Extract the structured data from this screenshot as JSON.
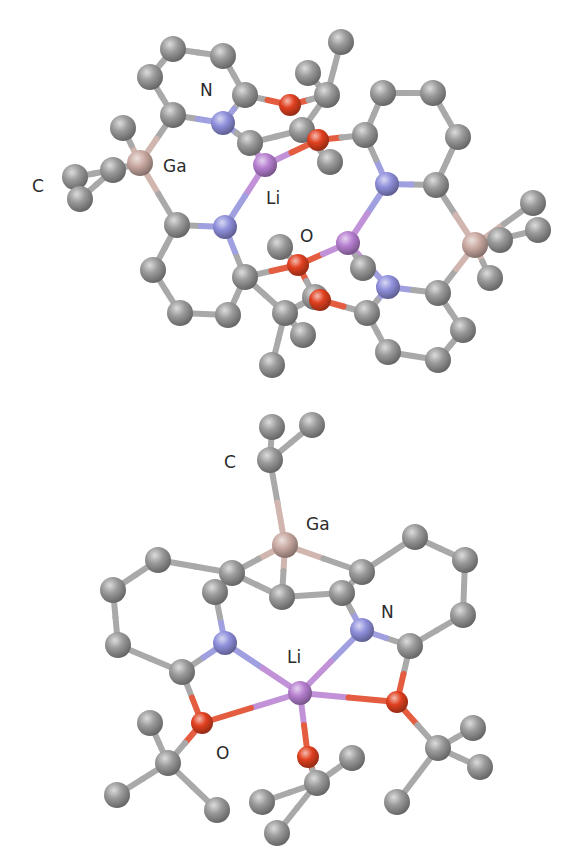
{
  "figure": {
    "panels": [
      {
        "id": "top",
        "description": "Dimeric Li/Ga complex, ball-and-stick",
        "labels": [
          {
            "text": "N",
            "x": 200,
            "y": 96
          },
          {
            "text": "Ga",
            "x": 163,
            "y": 172
          },
          {
            "text": "C",
            "x": 32,
            "y": 192
          },
          {
            "text": "Li",
            "x": 266,
            "y": 204
          },
          {
            "text": "O",
            "x": 300,
            "y": 242
          }
        ],
        "atoms": [
          {
            "id": "a1",
            "el": "C",
            "x": 173,
            "y": 49
          },
          {
            "id": "a2",
            "el": "C",
            "x": 223,
            "y": 56
          },
          {
            "id": "a3",
            "el": "C",
            "x": 150,
            "y": 77
          },
          {
            "id": "a4",
            "el": "C",
            "x": 245,
            "y": 95
          },
          {
            "id": "a5",
            "el": "C",
            "x": 173,
            "y": 115
          },
          {
            "id": "n1",
            "el": "N",
            "x": 223,
            "y": 123
          },
          {
            "id": "a6",
            "el": "C",
            "x": 250,
            "y": 143
          },
          {
            "id": "ga1",
            "el": "Ga",
            "x": 140,
            "y": 163
          },
          {
            "id": "m1",
            "el": "C",
            "x": 123,
            "y": 128
          },
          {
            "id": "m2",
            "el": "C",
            "x": 113,
            "y": 170
          },
          {
            "id": "m3",
            "el": "C",
            "x": 75,
            "y": 177
          },
          {
            "id": "m4",
            "el": "C",
            "x": 80,
            "y": 199
          },
          {
            "id": "li1",
            "el": "Li",
            "x": 265,
            "y": 165
          },
          {
            "id": "o1",
            "el": "O",
            "x": 290,
            "y": 105
          },
          {
            "id": "t1",
            "el": "C",
            "x": 341,
            "y": 42
          },
          {
            "id": "t2",
            "el": "C",
            "x": 308,
            "y": 73
          },
          {
            "id": "t3",
            "el": "C",
            "x": 327,
            "y": 95
          },
          {
            "id": "t4",
            "el": "C",
            "x": 302,
            "y": 130
          },
          {
            "id": "o2",
            "el": "O",
            "x": 318,
            "y": 140
          },
          {
            "id": "t5",
            "el": "C",
            "x": 330,
            "y": 162
          },
          {
            "id": "r1",
            "el": "C",
            "x": 383,
            "y": 93
          },
          {
            "id": "r2",
            "el": "C",
            "x": 433,
            "y": 93
          },
          {
            "id": "r3",
            "el": "C",
            "x": 365,
            "y": 135
          },
          {
            "id": "r4",
            "el": "C",
            "x": 458,
            "y": 137
          },
          {
            "id": "n2",
            "el": "N",
            "x": 387,
            "y": 184
          },
          {
            "id": "r5",
            "el": "C",
            "x": 436,
            "y": 185
          },
          {
            "id": "b1",
            "el": "C",
            "x": 177,
            "y": 225
          },
          {
            "id": "n3",
            "el": "N",
            "x": 225,
            "y": 227
          },
          {
            "id": "b2",
            "el": "C",
            "x": 153,
            "y": 270
          },
          {
            "id": "b3",
            "el": "C",
            "x": 245,
            "y": 277
          },
          {
            "id": "b4",
            "el": "C",
            "x": 180,
            "y": 313
          },
          {
            "id": "b5",
            "el": "C",
            "x": 228,
            "y": 315
          },
          {
            "id": "li2",
            "el": "Li",
            "x": 348,
            "y": 243
          },
          {
            "id": "q1",
            "el": "C",
            "x": 280,
            "y": 247
          },
          {
            "id": "o3",
            "el": "O",
            "x": 298,
            "y": 265
          },
          {
            "id": "q2",
            "el": "C",
            "x": 285,
            "y": 313
          },
          {
            "id": "q3",
            "el": "C",
            "x": 315,
            "y": 297
          },
          {
            "id": "q4",
            "el": "C",
            "x": 303,
            "y": 335
          },
          {
            "id": "q5",
            "el": "C",
            "x": 272,
            "y": 365
          },
          {
            "id": "q6",
            "el": "C",
            "x": 363,
            "y": 268
          },
          {
            "id": "o4",
            "el": "O",
            "x": 320,
            "y": 300
          },
          {
            "id": "ga2",
            "el": "Ga",
            "x": 475,
            "y": 245
          },
          {
            "id": "m5",
            "el": "C",
            "x": 533,
            "y": 203
          },
          {
            "id": "m6",
            "el": "C",
            "x": 538,
            "y": 230
          },
          {
            "id": "m7",
            "el": "C",
            "x": 500,
            "y": 240
          },
          {
            "id": "m8",
            "el": "C",
            "x": 490,
            "y": 278
          },
          {
            "id": "n4",
            "el": "N",
            "x": 388,
            "y": 287
          },
          {
            "id": "s1",
            "el": "C",
            "x": 438,
            "y": 293
          },
          {
            "id": "s2",
            "el": "C",
            "x": 367,
            "y": 313
          },
          {
            "id": "s3",
            "el": "C",
            "x": 463,
            "y": 330
          },
          {
            "id": "s4",
            "el": "C",
            "x": 388,
            "y": 352
          },
          {
            "id": "s5",
            "el": "C",
            "x": 438,
            "y": 360
          }
        ],
        "bonds": [
          [
            "a1",
            "a2"
          ],
          [
            "a1",
            "a3"
          ],
          [
            "a2",
            "a4"
          ],
          [
            "a3",
            "a5"
          ],
          [
            "a5",
            "n1"
          ],
          [
            "a4",
            "n1"
          ],
          [
            "n1",
            "a6"
          ],
          [
            "a5",
            "ga1"
          ],
          [
            "ga1",
            "m1"
          ],
          [
            "ga1",
            "m2"
          ],
          [
            "m2",
            "m3"
          ],
          [
            "m2",
            "m4"
          ],
          [
            "a6",
            "li1"
          ],
          [
            "a4",
            "o1"
          ],
          [
            "o1",
            "t3"
          ],
          [
            "t3",
            "t1"
          ],
          [
            "t3",
            "t2"
          ],
          [
            "t3",
            "t4"
          ],
          [
            "a6",
            "t4"
          ],
          [
            "li1",
            "o2"
          ],
          [
            "o2",
            "t4"
          ],
          [
            "o2",
            "r3"
          ],
          [
            "t4",
            "t5"
          ],
          [
            "r3",
            "r1"
          ],
          [
            "r1",
            "r2"
          ],
          [
            "r2",
            "r4"
          ],
          [
            "r4",
            "r5"
          ],
          [
            "r5",
            "n2"
          ],
          [
            "n2",
            "r3"
          ],
          [
            "n2",
            "li2"
          ],
          [
            "li1",
            "n3"
          ],
          [
            "r5",
            "ga2"
          ],
          [
            "ga1",
            "b1"
          ],
          [
            "b1",
            "n3"
          ],
          [
            "b1",
            "b2"
          ],
          [
            "b2",
            "b4"
          ],
          [
            "b4",
            "b5"
          ],
          [
            "b5",
            "b3"
          ],
          [
            "b3",
            "n3"
          ],
          [
            "b3",
            "o3"
          ],
          [
            "o3",
            "li2"
          ],
          [
            "o3",
            "q1"
          ],
          [
            "o3",
            "q3"
          ],
          [
            "b3",
            "q2"
          ],
          [
            "q2",
            "q4"
          ],
          [
            "q2",
            "q5"
          ],
          [
            "q2",
            "q3"
          ],
          [
            "li2",
            "n4"
          ],
          [
            "li2",
            "q6"
          ],
          [
            "n4",
            "s1"
          ],
          [
            "n4",
            "s2"
          ],
          [
            "s2",
            "o4"
          ],
          [
            "o4",
            "q3"
          ],
          [
            "s1",
            "ga2"
          ],
          [
            "s1",
            "s3"
          ],
          [
            "s3",
            "s5"
          ],
          [
            "s5",
            "s4"
          ],
          [
            "s4",
            "s2"
          ],
          [
            "ga2",
            "m5"
          ],
          [
            "ga2",
            "m6"
          ],
          [
            "ga2",
            "m7"
          ],
          [
            "ga2",
            "m8"
          ]
        ]
      },
      {
        "id": "bottom",
        "description": "Monomeric Li/Ga complex, ball-and-stick",
        "labels": [
          {
            "text": "C",
            "x": 224,
            "y": 468
          },
          {
            "text": "Ga",
            "x": 306,
            "y": 530
          },
          {
            "text": "N",
            "x": 381,
            "y": 618
          },
          {
            "text": "Li",
            "x": 287,
            "y": 663
          },
          {
            "text": "O",
            "x": 216,
            "y": 759
          }
        ],
        "atoms": [
          {
            "id": "c1",
            "el": "C",
            "x": 272,
            "y": 427
          },
          {
            "id": "c2",
            "el": "C",
            "x": 312,
            "y": 425
          },
          {
            "id": "c3",
            "el": "C",
            "x": 270,
            "y": 460
          },
          {
            "id": "ga",
            "el": "Ga",
            "x": 285,
            "y": 545
          },
          {
            "id": "l1",
            "el": "C",
            "x": 158,
            "y": 560
          },
          {
            "id": "l2",
            "el": "C",
            "x": 113,
            "y": 590
          },
          {
            "id": "l3",
            "el": "C",
            "x": 232,
            "y": 573
          },
          {
            "id": "l4",
            "el": "C",
            "x": 215,
            "y": 592
          },
          {
            "id": "l5",
            "el": "C",
            "x": 118,
            "y": 645
          },
          {
            "id": "mid",
            "el": "C",
            "x": 282,
            "y": 597
          },
          {
            "id": "r1",
            "el": "C",
            "x": 415,
            "y": 537
          },
          {
            "id": "r2",
            "el": "C",
            "x": 465,
            "y": 560
          },
          {
            "id": "r3",
            "el": "C",
            "x": 362,
            "y": 572
          },
          {
            "id": "r4",
            "el": "C",
            "x": 342,
            "y": 593
          },
          {
            "id": "r5",
            "el": "C",
            "x": 463,
            "y": 615
          },
          {
            "id": "nl",
            "el": "N",
            "x": 225,
            "y": 643
          },
          {
            "id": "nr",
            "el": "N",
            "x": 362,
            "y": 630
          },
          {
            "id": "cl",
            "el": "C",
            "x": 182,
            "y": 672
          },
          {
            "id": "cr",
            "el": "C",
            "x": 410,
            "y": 646
          },
          {
            "id": "li",
            "el": "Li",
            "x": 300,
            "y": 693
          },
          {
            "id": "ol",
            "el": "O",
            "x": 202,
            "y": 723
          },
          {
            "id": "or",
            "el": "O",
            "x": 397,
            "y": 702
          },
          {
            "id": "ob",
            "el": "O",
            "x": 308,
            "y": 757
          },
          {
            "id": "tl1",
            "el": "C",
            "x": 150,
            "y": 723
          },
          {
            "id": "tl2",
            "el": "C",
            "x": 168,
            "y": 763
          },
          {
            "id": "tl3",
            "el": "C",
            "x": 117,
            "y": 795
          },
          {
            "id": "tl4",
            "el": "C",
            "x": 217,
            "y": 810
          },
          {
            "id": "tb1",
            "el": "C",
            "x": 352,
            "y": 758
          },
          {
            "id": "tb2",
            "el": "C",
            "x": 317,
            "y": 783
          },
          {
            "id": "tb3",
            "el": "C",
            "x": 262,
            "y": 802
          },
          {
            "id": "tb4",
            "el": "C",
            "x": 277,
            "y": 833
          },
          {
            "id": "tr1",
            "el": "C",
            "x": 438,
            "y": 748
          },
          {
            "id": "tr2",
            "el": "C",
            "x": 473,
            "y": 728
          },
          {
            "id": "tr3",
            "el": "C",
            "x": 480,
            "y": 767
          },
          {
            "id": "tr4",
            "el": "C",
            "x": 397,
            "y": 802
          }
        ],
        "bonds": [
          [
            "c3",
            "c1"
          ],
          [
            "c3",
            "c2"
          ],
          [
            "c3",
            "ga"
          ],
          [
            "ga",
            "l3"
          ],
          [
            "ga",
            "mid"
          ],
          [
            "ga",
            "r3"
          ],
          [
            "l3",
            "l1"
          ],
          [
            "l1",
            "l2"
          ],
          [
            "l2",
            "l5"
          ],
          [
            "l5",
            "cl"
          ],
          [
            "cl",
            "nl"
          ],
          [
            "nl",
            "l4"
          ],
          [
            "l4",
            "l3"
          ],
          [
            "mid",
            "l3"
          ],
          [
            "mid",
            "r4"
          ],
          [
            "r4",
            "r3"
          ],
          [
            "r3",
            "r1"
          ],
          [
            "r1",
            "r2"
          ],
          [
            "r2",
            "r5"
          ],
          [
            "r5",
            "cr"
          ],
          [
            "cr",
            "nr"
          ],
          [
            "nr",
            "r4"
          ],
          [
            "nl",
            "li"
          ],
          [
            "nr",
            "li"
          ],
          [
            "li",
            "ol"
          ],
          [
            "li",
            "or"
          ],
          [
            "li",
            "ob"
          ],
          [
            "cl",
            "ol"
          ],
          [
            "cr",
            "or"
          ],
          [
            "ol",
            "tl2"
          ],
          [
            "tl2",
            "tl1"
          ],
          [
            "tl2",
            "tl3"
          ],
          [
            "tl2",
            "tl4"
          ],
          [
            "ob",
            "tb2"
          ],
          [
            "tb2",
            "tb1"
          ],
          [
            "tb2",
            "tb3"
          ],
          [
            "tb2",
            "tb4"
          ],
          [
            "or",
            "tr1"
          ],
          [
            "tr1",
            "tr2"
          ],
          [
            "tr1",
            "tr3"
          ],
          [
            "tr1",
            "tr4"
          ]
        ]
      }
    ],
    "element_colors": {
      "C": "#9a9a9a",
      "N": "#8f8fdc",
      "O": "#e0401f",
      "Li": "#b67fd0",
      "Ga": "#c9a9a1"
    },
    "element_radius": {
      "C": 13,
      "N": 12,
      "O": 11,
      "Li": 12,
      "Ga": 13
    },
    "bond_width": 6
  }
}
